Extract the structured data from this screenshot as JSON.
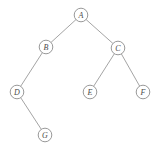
{
  "figure": {
    "caption": "",
    "width": 158,
    "height": 155,
    "background_color": "#ffffff",
    "node_fill_color": "#ffffff",
    "node_stroke_color": "#8d8d8d",
    "edge_color": "#9a9a9a",
    "label_color": "#4a4a4a",
    "node_radius": 6.8
  },
  "chart_data": {
    "type": "diagram",
    "subtype": "binary-tree",
    "title": "",
    "nodes": [
      {
        "id": "A",
        "label": "A",
        "x": 81,
        "y": 15,
        "depth": 0
      },
      {
        "id": "B",
        "label": "B",
        "x": 46,
        "y": 47,
        "depth": 1
      },
      {
        "id": "C",
        "label": "C",
        "x": 118,
        "y": 48,
        "depth": 1
      },
      {
        "id": "D",
        "label": "D",
        "x": 17,
        "y": 92,
        "depth": 2
      },
      {
        "id": "E",
        "label": "E",
        "x": 90,
        "y": 92,
        "depth": 2
      },
      {
        "id": "F",
        "label": "F",
        "x": 143,
        "y": 92,
        "depth": 2
      },
      {
        "id": "G",
        "label": "G",
        "x": 45,
        "y": 135,
        "depth": 3
      }
    ],
    "edges": [
      {
        "from": "A",
        "to": "B",
        "side": "left"
      },
      {
        "from": "A",
        "to": "C",
        "side": "right"
      },
      {
        "from": "B",
        "to": "D",
        "side": "left"
      },
      {
        "from": "C",
        "to": "E",
        "side": "left"
      },
      {
        "from": "C",
        "to": "F",
        "side": "right"
      },
      {
        "from": "D",
        "to": "G",
        "side": "right"
      }
    ],
    "root": "A"
  }
}
